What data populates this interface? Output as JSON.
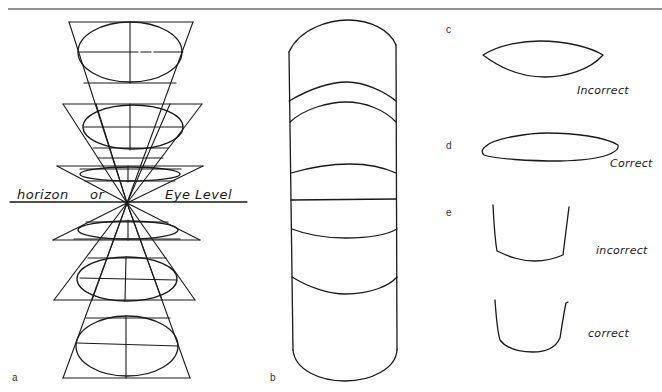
{
  "figure": {
    "panels": {
      "a": {
        "label": "a",
        "horizon_text": {
          "word1": "horizon",
          "word2": "or",
          "word3": "Eye Level"
        },
        "ellipse_count": 6
      },
      "b": {
        "label": "b",
        "band_count": 6
      },
      "c": {
        "label": "c",
        "verdict": "Incorrect"
      },
      "d": {
        "label": "d",
        "verdict": "Correct"
      },
      "e": {
        "label": "e",
        "verdict_top": "incorrect",
        "verdict_bottom": "correct"
      }
    },
    "colors": {
      "ink": "#1a1a1a",
      "rule": "#6b6b6b",
      "background": "#ffffff"
    }
  }
}
